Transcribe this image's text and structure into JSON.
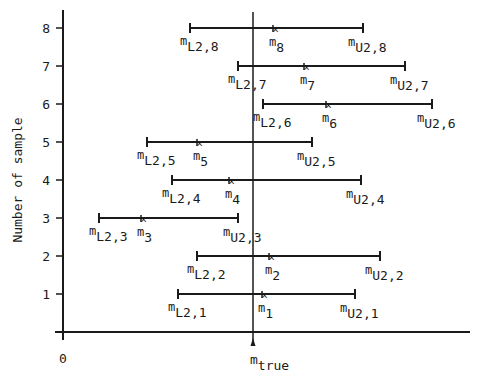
{
  "chart_data": {
    "type": "scatter",
    "title": "",
    "xlabel": "",
    "ylabel": "Number of sample",
    "x_origin_label": "0",
    "true_value_label": {
      "base": "m",
      "sub": "true"
    },
    "yticks": [
      1,
      2,
      3,
      4,
      5,
      6,
      7,
      8
    ],
    "grid": false,
    "legend": null,
    "ylim": [
      0,
      8.5
    ],
    "xlim_px": [
      63,
      470
    ],
    "true_x": 253,
    "intervals": [
      {
        "sample": 1,
        "lower": 178,
        "estimate": 262,
        "upper": 355,
        "lower_label": "L2,1",
        "estimate_label": "1",
        "upper_label": "U2,1"
      },
      {
        "sample": 2,
        "lower": 197,
        "estimate": 269,
        "upper": 380,
        "lower_label": "L2,2",
        "estimate_label": "2",
        "upper_label": "U2,2"
      },
      {
        "sample": 3,
        "lower": 99,
        "estimate": 141,
        "upper": 238,
        "lower_label": "L2,3",
        "estimate_label": "3",
        "upper_label": "U2,3"
      },
      {
        "sample": 4,
        "lower": 172,
        "estimate": 229,
        "upper": 361,
        "lower_label": "L2,4",
        "estimate_label": "4",
        "upper_label": "U2,4"
      },
      {
        "sample": 5,
        "lower": 147,
        "estimate": 197,
        "upper": 312,
        "lower_label": "L2,5",
        "estimate_label": "5",
        "upper_label": "U2,5"
      },
      {
        "sample": 6,
        "lower": 263,
        "estimate": 326,
        "upper": 432,
        "lower_label": "L2,6",
        "estimate_label": "6",
        "upper_label": "U2,6"
      },
      {
        "sample": 7,
        "lower": 238,
        "estimate": 304,
        "upper": 405,
        "lower_label": "L2,7",
        "estimate_label": "7",
        "upper_label": "U2,7"
      },
      {
        "sample": 8,
        "lower": 190,
        "estimate": 273,
        "upper": 363,
        "lower_label": "L2,8",
        "estimate_label": "8",
        "upper_label": "U2,8"
      }
    ]
  }
}
